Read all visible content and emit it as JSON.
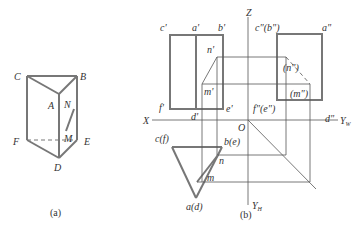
{
  "figure_a": {
    "caption": "(a)",
    "vertices": {
      "C": "C",
      "B": "B",
      "A": "A",
      "N": "N",
      "F": "F",
      "M": "M",
      "E": "E",
      "D": "D"
    }
  },
  "figure_b": {
    "caption": "(b)",
    "axes": {
      "X": "X",
      "Z": "Z",
      "O": "O",
      "YW": "Y",
      "YW_sub": "W",
      "YH": "Y",
      "YH_sub": "H"
    },
    "front_view": {
      "c": "c'",
      "a": "a'",
      "b": "b'",
      "n": "n'",
      "m": "m'",
      "f": "f'",
      "d": "d'",
      "e": "e'"
    },
    "side_view": {
      "cb": "c\"(b\")",
      "a": "a\"",
      "n": "(n\")",
      "m": "(m\")",
      "fe": "f\"(e\")",
      "d": "d\""
    },
    "top_view": {
      "cf": "c(f)",
      "be": "b(e)",
      "n": "n",
      "m": "m",
      "ad": "a(d)"
    }
  },
  "colors": {
    "thick": "#777777",
    "thin": "#555555",
    "text": "#333333"
  }
}
